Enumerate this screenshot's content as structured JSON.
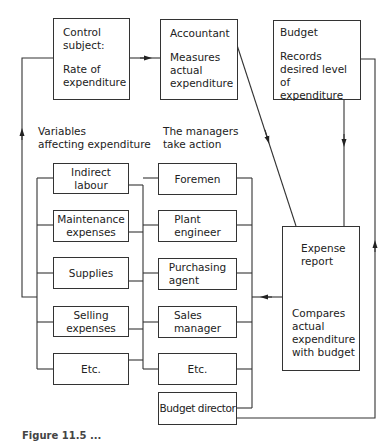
{
  "diagram": {
    "type": "control-loop flowchart",
    "top_row": [
      {
        "id": "control-subject",
        "title": "Control\nsubject:",
        "body": "Rate of\nexpenditure"
      },
      {
        "id": "accountant",
        "title": "Accountant",
        "body": "Measures\nactual\nexpenditure"
      },
      {
        "id": "budget",
        "title": "Budget",
        "body": "Records\ndesired level of\nexpenditure"
      }
    ],
    "column_headers": {
      "variables": "Variables\naffecting expenditure",
      "managers": "The managers\ntake action"
    },
    "variables": [
      "Indirect\nlabour",
      "Maintenance\nexpenses",
      "Supplies",
      "Selling\nexpenses",
      "Etc."
    ],
    "managers": [
      "Foremen",
      "Plant\nengineer",
      "Purchasing\nagent",
      "Sales\nmanager",
      "Etc.",
      "Budget director"
    ],
    "expense_report": {
      "title": "Expense\nreport",
      "body": "Compares\nactual\nexpenditure\nwith budget"
    },
    "edges": [
      {
        "from": "control-subject",
        "to": "accountant"
      },
      {
        "from": "accountant",
        "to": "expense-report"
      },
      {
        "from": "budget",
        "to": "expense-report"
      },
      {
        "from": "expense-report",
        "to": "managers"
      },
      {
        "from": "budget-director",
        "to": "budget"
      },
      {
        "from": "variables",
        "to": "control-subject"
      }
    ],
    "caption": "Figure 11.5 ..."
  }
}
